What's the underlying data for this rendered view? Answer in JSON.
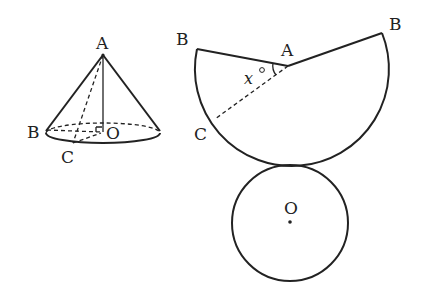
{
  "figure": {
    "cone": {
      "labels": {
        "apex": "A",
        "base_point_1": "B",
        "base_point_2": "C",
        "center": "O"
      },
      "right_angle_marker": true
    },
    "net_sector": {
      "labels": {
        "center": "A",
        "left_end": "B",
        "right_end": "B",
        "arc_point": "C"
      },
      "angle_label": "x°",
      "angle_var": "x",
      "angle_unit": "°"
    },
    "net_circle": {
      "labels": {
        "center": "O"
      }
    },
    "colors": {
      "stroke": "#222222",
      "background": "#ffffff"
    }
  }
}
